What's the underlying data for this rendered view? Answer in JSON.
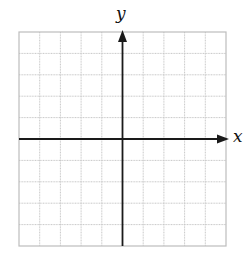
{
  "figure": {
    "type": "coordinate-plane",
    "x_axis_label": "x",
    "y_axis_label": "y",
    "grid": {
      "columns": 10,
      "rows": 10,
      "left": 19,
      "top": 32,
      "right": 226,
      "bottom": 246,
      "line_color": "#c8c8c8",
      "border_color": "#bdbdbd"
    },
    "axes": {
      "origin_column": 5,
      "origin_row": 5,
      "color": "#1a1a1a",
      "x_arrow": "right",
      "y_arrow": "up"
    }
  }
}
